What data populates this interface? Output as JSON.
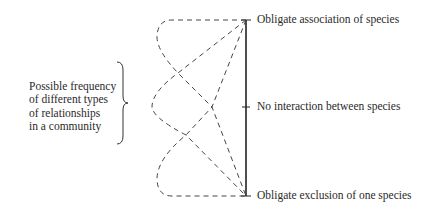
{
  "left_label": {
    "lines": [
      "Possible frequency",
      "of different types",
      "of relationships",
      "in a community"
    ]
  },
  "axis": {
    "top_label": "Obligate association of species",
    "middle_label": "No interaction between species",
    "bottom_label": "Obligate exclusion of one species"
  },
  "curves": [
    {
      "name": "skewed-toward-association"
    },
    {
      "name": "centered-on-no-interaction"
    },
    {
      "name": "skewed-toward-exclusion"
    }
  ]
}
